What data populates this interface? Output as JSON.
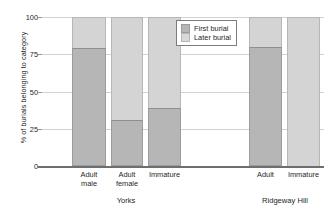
{
  "chart_data": {
    "type": "bar",
    "subtype": "stacked-percentage",
    "title": "",
    "xlabel": "",
    "ylabel": "% of burials belonging to category",
    "ylim": [
      0,
      100
    ],
    "yticks": [
      0,
      25,
      50,
      75,
      100
    ],
    "ytick_labels": [
      "0",
      "25",
      "50",
      "75",
      "100"
    ],
    "grid": true,
    "grid_axis": "y",
    "legend_position": "upper-center-right",
    "categories": [
      "Adult male",
      "Adult female",
      "Immature",
      "Adult",
      "Immature"
    ],
    "groups": [
      {
        "name": "Yorks",
        "categories": [
          "Adult male",
          "Adult female",
          "Immature"
        ]
      },
      {
        "name": "Ridgeway Hill",
        "categories": [
          "Adult",
          "Immature"
        ]
      }
    ],
    "series": [
      {
        "name": "First burial",
        "color": "#b6b6b6",
        "values": [
          79,
          31,
          39,
          80,
          0
        ]
      },
      {
        "name": "Later burial",
        "color": "#d4d4d4",
        "values": [
          21,
          69,
          61,
          20,
          100
        ]
      }
    ]
  },
  "axis": {
    "y_title": "% of burials belonging to category",
    "ticks": [
      {
        "label": "100",
        "value": 100
      },
      {
        "label": "75",
        "value": 75
      },
      {
        "label": "50",
        "value": 50
      },
      {
        "label": "25",
        "value": 25
      },
      {
        "label": "0",
        "value": 0
      }
    ]
  },
  "legend": {
    "entries": [
      {
        "label": "First burial",
        "swatch": "first"
      },
      {
        "label": "Later burial",
        "swatch": "later"
      }
    ]
  },
  "bars": [
    {
      "cat_line1": "Adult",
      "cat_line2": "male",
      "first": 79,
      "later": 21,
      "left": 72,
      "width": 34
    },
    {
      "cat_line1": "Adult",
      "cat_line2": "female",
      "first": 31,
      "later": 69,
      "left": 111,
      "width": 32
    },
    {
      "cat_line1": "Immature",
      "cat_line2": "",
      "first": 39,
      "later": 61,
      "left": 148,
      "width": 33
    },
    {
      "cat_line1": "Adult",
      "cat_line2": "",
      "first": 80,
      "later": 20,
      "left": 249,
      "width": 33
    },
    {
      "cat_line1": "Immature",
      "cat_line2": "",
      "first": 0,
      "later": 100,
      "left": 287,
      "width": 33
    }
  ],
  "groups": [
    {
      "label": "Yorks",
      "center": 126
    },
    {
      "label": "Ridgeway Hill",
      "center": 285
    }
  ]
}
